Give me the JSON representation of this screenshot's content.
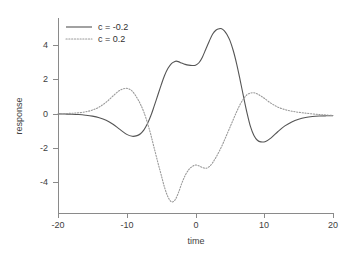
{
  "chart_data": {
    "type": "line",
    "title": "",
    "xlabel": "time",
    "ylabel": "response",
    "xlim": [
      -20,
      20
    ],
    "ylim": [
      -6.2,
      6.0
    ],
    "grid": false,
    "legend_position": "top-left",
    "xticks": [
      -20,
      -10,
      0,
      10,
      20
    ],
    "xticklabels": [
      "-20",
      "-10",
      "0",
      "10",
      "20"
    ],
    "yticks": [
      4,
      2,
      0,
      -2,
      -4
    ],
    "yticklabels": [
      "4",
      "2",
      "0",
      "-2",
      "-4"
    ],
    "colors": {
      "series_1": "#555555",
      "series_2": "#9a9a9a",
      "axis": "#8a8a8a",
      "text": "#404040",
      "background": "#ffffff"
    },
    "series": [
      {
        "name": "c = -0.2",
        "label_prefix": "c",
        "label_value": "= -0.2",
        "style": "solid",
        "color": "#555555",
        "x": [
          -20,
          -19,
          -18,
          -17,
          -16,
          -15,
          -14,
          -13,
          -12,
          -11,
          -10,
          -9.2,
          -8.5,
          -8,
          -7.5,
          -7,
          -6.5,
          -6,
          -5.5,
          -5,
          -4.5,
          -4,
          -3.5,
          -3,
          -2.8,
          -2.5,
          -2,
          -1.5,
          -1,
          -0.5,
          0,
          0.5,
          1,
          1.5,
          2,
          2.5,
          3,
          3.5,
          3.8,
          4.2,
          4.6,
          5,
          5.5,
          6,
          6.5,
          7,
          7.5,
          8,
          8.5,
          9,
          9.5,
          10.2,
          11,
          12,
          13,
          14,
          15,
          16,
          17,
          18,
          19,
          20
        ],
        "y": [
          0,
          -0.01,
          -0.02,
          -0.04,
          -0.08,
          -0.14,
          -0.24,
          -0.4,
          -0.65,
          -0.97,
          -1.28,
          -1.4,
          -1.36,
          -1.24,
          -1.0,
          -0.62,
          -0.12,
          0.5,
          1.15,
          1.8,
          2.4,
          2.85,
          3.15,
          3.28,
          3.3,
          3.27,
          3.18,
          3.1,
          3.05,
          3.03,
          3.05,
          3.2,
          3.55,
          4.05,
          4.55,
          5.0,
          5.25,
          5.33,
          5.33,
          5.2,
          4.95,
          4.6,
          3.95,
          3.1,
          2.1,
          1.05,
          0.05,
          -0.8,
          -1.35,
          -1.65,
          -1.75,
          -1.72,
          -1.5,
          -1.1,
          -0.75,
          -0.5,
          -0.33,
          -0.22,
          -0.16,
          -0.13,
          -0.12,
          -0.12
        ]
      },
      {
        "name": "c = 0.2",
        "label_prefix": "c",
        "label_value": "= 0.2",
        "style": "dotted",
        "color": "#9a9a9a",
        "x": [
          -20,
          -19,
          -18,
          -17,
          -16,
          -15,
          -14,
          -13,
          -12,
          -11,
          -10,
          -9.2,
          -8.5,
          -8,
          -7.5,
          -7,
          -6.5,
          -6,
          -5.5,
          -5,
          -4.5,
          -4,
          -3.5,
          -3,
          -2.5,
          -2,
          -1.5,
          -1,
          -0.5,
          0,
          0.5,
          1,
          1.5,
          2,
          2.5,
          3,
          3.5,
          4,
          4.5,
          5,
          5.5,
          6,
          6.5,
          7,
          7.5,
          8,
          8.5,
          9,
          9.5,
          10,
          11,
          12,
          13,
          14,
          15,
          16,
          17,
          18,
          19,
          20
        ],
        "y": [
          0,
          0.02,
          0.04,
          0.07,
          0.13,
          0.24,
          0.43,
          0.73,
          1.12,
          1.48,
          1.6,
          1.42,
          1.0,
          0.6,
          0.1,
          -0.55,
          -1.3,
          -2.15,
          -3.0,
          -3.8,
          -4.6,
          -5.2,
          -5.5,
          -5.4,
          -4.95,
          -4.35,
          -3.85,
          -3.5,
          -3.3,
          -3.2,
          -3.25,
          -3.35,
          -3.4,
          -3.3,
          -3.05,
          -2.7,
          -2.3,
          -1.85,
          -1.35,
          -0.85,
          -0.35,
          0.15,
          0.6,
          0.95,
          1.2,
          1.3,
          1.32,
          1.25,
          1.12,
          0.98,
          0.66,
          0.42,
          0.27,
          0.17,
          0.1,
          0.05,
          0.0,
          -0.04,
          -0.07,
          -0.1
        ]
      }
    ]
  },
  "legend": {
    "entries": [
      {
        "label": "c = -0.2",
        "style": "solid"
      },
      {
        "label": "c = 0.2",
        "style": "dotted"
      }
    ]
  }
}
